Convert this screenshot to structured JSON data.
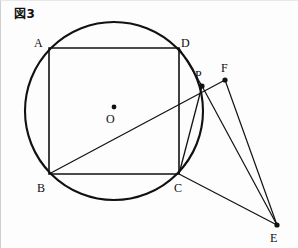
{
  "figure": {
    "caption": "図3",
    "caption_symbol": "図",
    "caption_number": "3",
    "width": 298,
    "height": 248,
    "background_color": "#fdfdfd",
    "stroke_color": "#111111"
  },
  "geometry": {
    "circle": {
      "label": "circumscribed-circle",
      "center_label": "O",
      "cx": 113,
      "cy": 110,
      "r": 89,
      "stroke_width": 2.1
    },
    "center_point": {
      "name": "O",
      "x": 113,
      "y": 106,
      "dot_r": 2.4,
      "label_x": 105,
      "label_y": 112
    },
    "square": {
      "name": "ABCD",
      "stroke_width": 1.6,
      "vertices": [
        {
          "name": "A",
          "x": 48,
          "y": 47,
          "label_x": 33,
          "label_y": 36
        },
        {
          "name": "D",
          "x": 178,
          "y": 47,
          "label_x": 180,
          "label_y": 36
        },
        {
          "name": "C",
          "x": 178,
          "y": 173,
          "label_x": 173,
          "label_y": 181
        },
        {
          "name": "B",
          "x": 48,
          "y": 173,
          "label_x": 36,
          "label_y": 181
        }
      ]
    },
    "points": [
      {
        "name": "P",
        "x": 201,
        "y": 85,
        "dot_r": 2.6,
        "label_x": 194,
        "label_y": 68,
        "has_dot": true
      },
      {
        "name": "F",
        "x": 224,
        "y": 79,
        "dot_r": 2.6,
        "label_x": 220,
        "label_y": 61,
        "has_dot": true
      },
      {
        "name": "E",
        "x": 276,
        "y": 224,
        "dot_r": 2.6,
        "label_x": 269,
        "label_y": 231,
        "has_dot": true
      }
    ],
    "segments": [
      {
        "name": "segment-B-F",
        "x1": 48,
        "y1": 173,
        "x2": 224,
        "y2": 79,
        "stroke_width": 1.2
      },
      {
        "name": "segment-D-P",
        "x1": 178,
        "y1": 47,
        "x2": 201,
        "y2": 85,
        "stroke_width": 1.3
      },
      {
        "name": "segment-P-C",
        "x1": 201,
        "y1": 85,
        "x2": 178,
        "y2": 173,
        "stroke_width": 1.3
      },
      {
        "name": "segment-F-E",
        "x1": 224,
        "y1": 79,
        "x2": 276,
        "y2": 224,
        "stroke_width": 1.2
      },
      {
        "name": "segment-C-E",
        "x1": 178,
        "y1": 173,
        "x2": 276,
        "y2": 224,
        "stroke_width": 1.2
      },
      {
        "name": "segment-P-E",
        "x1": 201,
        "y1": 85,
        "x2": 276,
        "y2": 224,
        "stroke_width": 1.2
      }
    ]
  }
}
